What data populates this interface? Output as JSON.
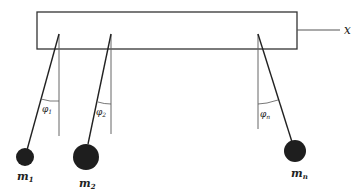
{
  "diagram": {
    "axis_label": "x",
    "pendulums": [
      {
        "mass_label": "m",
        "mass_sub": "1",
        "angle_label": "φ",
        "angle_sub": "1"
      },
      {
        "mass_label": "m",
        "mass_sub": "2",
        "angle_label": "φ",
        "angle_sub": "2"
      },
      {
        "mass_label": "m",
        "mass_sub": "n",
        "angle_label": "φ",
        "angle_sub": "n"
      }
    ],
    "colors": {
      "line": "#222222",
      "ref_line": "#555555",
      "mass": "#1e1e1e"
    }
  }
}
